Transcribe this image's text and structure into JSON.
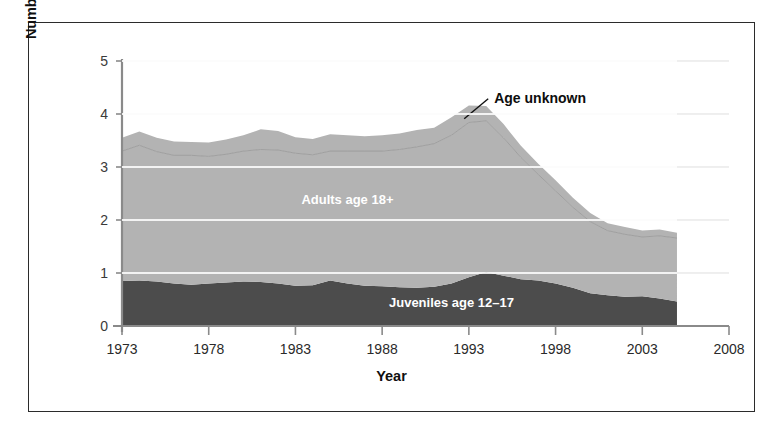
{
  "chart_data": {
    "type": "area",
    "stacked": true,
    "title": "",
    "xlabel": "Year",
    "ylabel": "Number of Incidents (Millions)",
    "xlim": [
      1973,
      2008
    ],
    "ylim": [
      0,
      5
    ],
    "xticks": [
      1973,
      1978,
      1983,
      1988,
      1993,
      1998,
      2003,
      2008
    ],
    "yticks": [
      0,
      1,
      2,
      3,
      4,
      5
    ],
    "xtick_labels": [
      "1973",
      "1978",
      "1983",
      "1988",
      "1993",
      "1998",
      "2003",
      "2008"
    ],
    "ytick_labels": [
      "0",
      "1",
      "2",
      "3",
      "4",
      "5"
    ],
    "grid": "horizontal",
    "legend_position": "inline-annotations",
    "colors": {
      "juveniles": "#4c4c4c",
      "adults": "#b3b3b3",
      "age_unknown": "#b3b3b3",
      "gridline": "#ffffff",
      "axis": "#8a8a8a",
      "border": "#2b2b2b",
      "text": "#101010"
    },
    "x": [
      1973,
      1974,
      1975,
      1976,
      1977,
      1978,
      1979,
      1980,
      1981,
      1982,
      1983,
      1984,
      1985,
      1986,
      1987,
      1988,
      1989,
      1990,
      1991,
      1992,
      1993,
      1994,
      1995,
      1996,
      1997,
      1998,
      1999,
      2000,
      2001,
      2002,
      2003,
      2004,
      2005
    ],
    "series": [
      {
        "name": "Juveniles age 12-17",
        "label": "Juveniles age 12–17",
        "color": "#4c4c4c",
        "values": [
          0.85,
          0.86,
          0.84,
          0.8,
          0.78,
          0.8,
          0.82,
          0.84,
          0.83,
          0.8,
          0.76,
          0.77,
          0.86,
          0.8,
          0.76,
          0.75,
          0.73,
          0.72,
          0.74,
          0.8,
          0.92,
          1.02,
          0.95,
          0.88,
          0.86,
          0.8,
          0.72,
          0.62,
          0.58,
          0.55,
          0.56,
          0.52,
          0.46
        ]
      },
      {
        "name": "Adults age 18+",
        "label": "Adults age 18+",
        "color": "#b3b3b3",
        "values": [
          2.45,
          2.55,
          2.45,
          2.42,
          2.44,
          2.4,
          2.42,
          2.46,
          2.5,
          2.52,
          2.5,
          2.46,
          2.44,
          2.5,
          2.54,
          2.55,
          2.6,
          2.66,
          2.7,
          2.8,
          2.92,
          2.85,
          2.6,
          2.3,
          2.0,
          1.75,
          1.52,
          1.35,
          1.22,
          1.18,
          1.12,
          1.18,
          1.2
        ]
      },
      {
        "name": "Age unknown",
        "label": "Age unknown",
        "color": "#b3b3b3",
        "values": [
          0.25,
          0.26,
          0.26,
          0.26,
          0.25,
          0.26,
          0.28,
          0.3,
          0.38,
          0.36,
          0.3,
          0.3,
          0.32,
          0.3,
          0.28,
          0.3,
          0.3,
          0.32,
          0.3,
          0.34,
          0.32,
          0.28,
          0.26,
          0.22,
          0.2,
          0.2,
          0.18,
          0.16,
          0.14,
          0.14,
          0.12,
          0.12,
          0.1
        ]
      }
    ],
    "totals": [
      3.55,
      3.67,
      3.55,
      3.48,
      3.47,
      3.46,
      3.52,
      3.6,
      3.71,
      3.68,
      3.56,
      3.53,
      3.62,
      3.6,
      3.58,
      3.6,
      3.63,
      3.7,
      3.74,
      3.94,
      4.16,
      4.15,
      3.81,
      3.4,
      3.06,
      2.75,
      2.42,
      2.13,
      1.94,
      1.87,
      1.8,
      1.82,
      1.76
    ],
    "annotations": [
      {
        "name": "age-unknown-callout",
        "text": "Age unknown",
        "x": 1994,
        "y": 4.25,
        "leader": true
      },
      {
        "name": "adults-inline-label",
        "text": "Adults age 18+",
        "x": 1986,
        "y": 2.3
      },
      {
        "name": "juveniles-inline-label",
        "text": "Juveniles age 12–17",
        "x": 1992,
        "y": 0.35
      }
    ]
  }
}
